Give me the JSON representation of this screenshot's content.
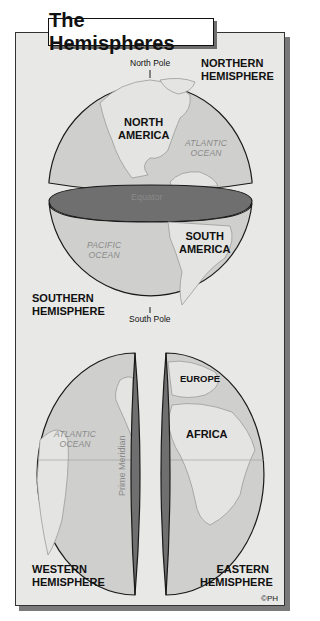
{
  "title": "The Hemispheres",
  "labels": {
    "north_pole": "North Pole",
    "south_pole": "South Pole",
    "northern_hemisphere": [
      "NORTHERN",
      "HEMISPHERE"
    ],
    "southern_hemisphere": [
      "SOUTHERN",
      "HEMISPHERE"
    ],
    "western_hemisphere": [
      "WESTERN",
      "HEMISPHERE"
    ],
    "eastern_hemisphere": [
      "EASTERN",
      "HEMISPHERE"
    ],
    "equator": "Equator",
    "prime_meridian": "Prime Meridian",
    "copyright": "©PH"
  },
  "continents": {
    "north_america": [
      "NORTH",
      "AMERICA"
    ],
    "south_america": [
      "SOUTH",
      "AMERICA"
    ],
    "europe": "EUROPE",
    "africa": "AFRICA"
  },
  "oceans": {
    "atlantic_top": [
      "ATLANTIC",
      "OCEAN"
    ],
    "pacific": [
      "PACIFIC",
      "OCEAN"
    ],
    "atlantic_bottom": [
      "ATLANTIC",
      "OCEAN"
    ]
  },
  "colors": {
    "panel": "#e8e8e6",
    "ocean": "#cfcfcd",
    "land": "#e4e4e2",
    "cut_face": "#6f6f6f",
    "outline": "#1a1a1a"
  }
}
